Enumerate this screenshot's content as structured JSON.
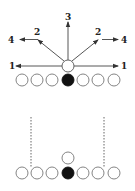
{
  "top_diagram": {
    "center_player": {
      "x": 68,
      "y": 66,
      "filled": false
    },
    "line": [
      {
        "x": 22,
        "y": 80,
        "filled": false
      },
      {
        "x": 37,
        "y": 80,
        "filled": false
      },
      {
        "x": 52,
        "y": 80,
        "filled": false
      },
      {
        "x": 68,
        "y": 80,
        "filled": true
      },
      {
        "x": 83,
        "y": 80,
        "filled": false
      },
      {
        "x": 98,
        "y": 80,
        "filled": false
      },
      {
        "x": 114,
        "y": 80,
        "filled": false
      }
    ],
    "labels": {
      "left_1": "1",
      "right_1": "1",
      "left_2": "2",
      "right_2": "2",
      "top_3": "3",
      "left_4": "4",
      "right_4": "4"
    }
  },
  "bottom_diagram": {
    "back_player": {
      "x": 68,
      "y": 158,
      "filled": false
    },
    "line": [
      {
        "x": 22,
        "y": 173,
        "filled": false
      },
      {
        "x": 37,
        "y": 173,
        "filled": false
      },
      {
        "x": 52,
        "y": 173,
        "filled": false
      },
      {
        "x": 68,
        "y": 173,
        "filled": true
      },
      {
        "x": 83,
        "y": 173,
        "filled": false
      },
      {
        "x": 98,
        "y": 173,
        "filled": false
      },
      {
        "x": 114,
        "y": 173,
        "filled": false
      }
    ],
    "dashed_lines": [
      {
        "x": 31,
        "y1": 117,
        "y2": 168
      },
      {
        "x": 104,
        "y1": 117,
        "y2": 168
      }
    ]
  },
  "colors": {
    "stroke": "#555555",
    "fill_dark": "#111111"
  }
}
